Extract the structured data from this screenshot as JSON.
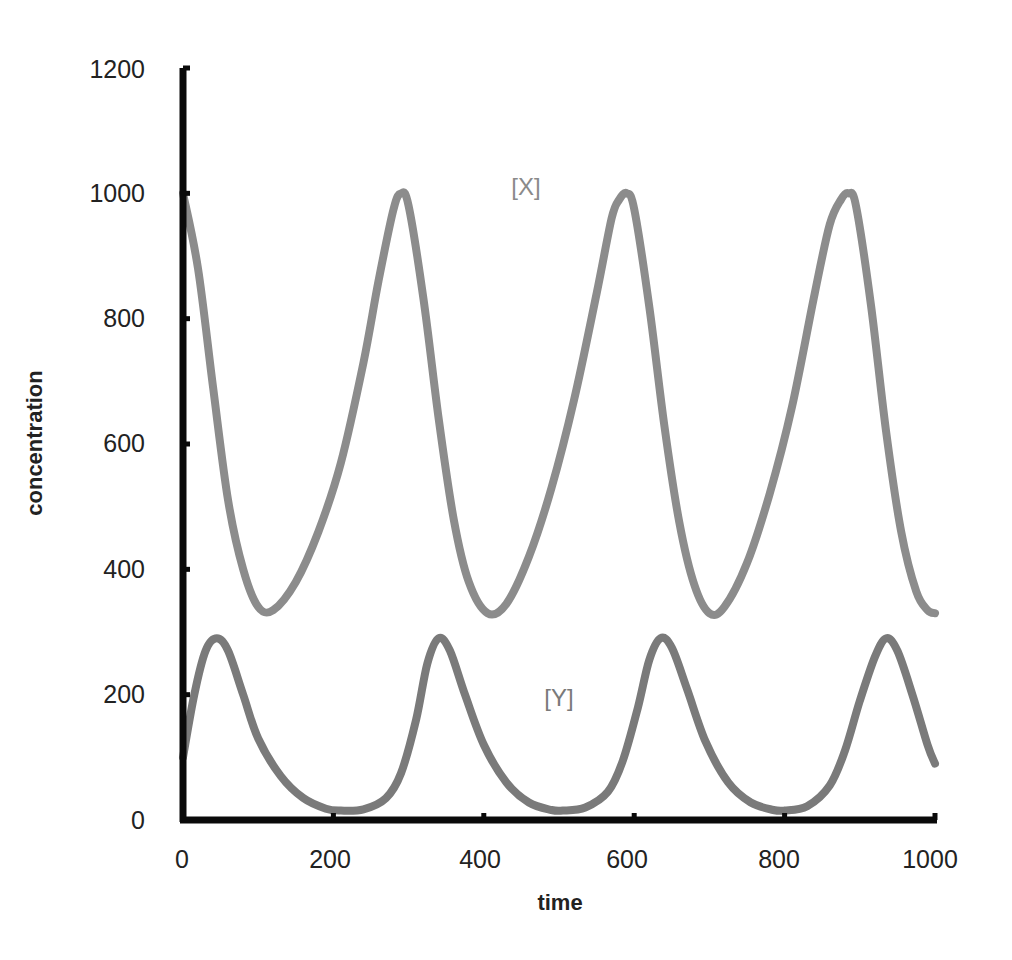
{
  "chart_data": {
    "type": "line",
    "title": "",
    "xlabel": "time",
    "ylabel": "concentration",
    "xlim": [
      0,
      1000
    ],
    "ylim": [
      0,
      1200
    ],
    "x_ticks": [
      0,
      200,
      400,
      600,
      800,
      1000
    ],
    "y_ticks": [
      0,
      200,
      400,
      600,
      800,
      1000,
      1200
    ],
    "grid": false,
    "legend": "inline labels",
    "annotations": [
      {
        "text": "[X]",
        "x": 460,
        "y": 1005
      },
      {
        "text": "[Y]",
        "x": 500,
        "y": 195
      }
    ],
    "series": [
      {
        "name": "[X]",
        "color": "#8c8c8c",
        "x": [
          0,
          20,
          40,
          60,
          80,
          100,
          120,
          150,
          180,
          210,
          240,
          260,
          280,
          290,
          300,
          320,
          340,
          360,
          380,
          405,
          430,
          460,
          490,
          520,
          550,
          570,
          580,
          590,
          600,
          620,
          640,
          660,
          680,
          700,
          720,
          750,
          780,
          810,
          840,
          860,
          875,
          885,
          895,
          915,
          935,
          955,
          975,
          990,
          1000
        ],
        "values": [
          1000,
          880,
          690,
          510,
          400,
          340,
          335,
          380,
          460,
          570,
          730,
          860,
          975,
          1000,
          980,
          830,
          640,
          480,
          380,
          330,
          345,
          420,
          530,
          670,
          840,
          960,
          990,
          1000,
          975,
          820,
          630,
          475,
          375,
          330,
          340,
          410,
          520,
          660,
          840,
          950,
          990,
          1000,
          980,
          820,
          620,
          460,
          365,
          335,
          330
        ]
      },
      {
        "name": "[Y]",
        "color": "#7a7a7a",
        "x": [
          0,
          15,
          30,
          45,
          60,
          80,
          100,
          130,
          160,
          190,
          210,
          240,
          270,
          290,
          310,
          325,
          340,
          355,
          375,
          400,
          430,
          460,
          490,
          505,
          535,
          565,
          585,
          605,
          620,
          635,
          650,
          670,
          695,
          725,
          755,
          785,
          800,
          830,
          860,
          880,
          900,
          920,
          935,
          950,
          970,
          990,
          1000
        ],
        "values": [
          100,
          200,
          270,
          290,
          270,
          200,
          130,
          70,
          35,
          18,
          15,
          17,
          35,
          75,
          160,
          250,
          290,
          270,
          200,
          120,
          60,
          28,
          16,
          15,
          20,
          45,
          95,
          180,
          255,
          290,
          275,
          210,
          125,
          60,
          28,
          16,
          15,
          22,
          55,
          110,
          190,
          260,
          290,
          270,
          200,
          120,
          90
        ]
      }
    ]
  },
  "labels": {
    "x_axis_title": "time",
    "y_axis_title": "concentration",
    "series_x": "[X]",
    "series_y": "[Y]",
    "x_ticks": [
      "0",
      "200",
      "400",
      "600",
      "800",
      "1000"
    ],
    "y_ticks": [
      "0",
      "200",
      "400",
      "600",
      "800",
      "1000",
      "1200"
    ]
  },
  "colors": {
    "axis": "#0a0a0a",
    "series_x": "#8c8c8c",
    "series_y": "#7a7a7a",
    "label_x": "#8a8a8a",
    "label_y": "#7a7a7a"
  }
}
